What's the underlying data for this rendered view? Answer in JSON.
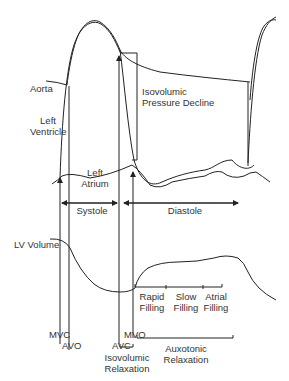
{
  "diagram": {
    "type": "cardiac-cycle-wiggers",
    "traces": {
      "aorta": "Aorta",
      "left_ventricle_line1": "Left",
      "left_ventricle_line2": "Ventricle",
      "left_atrium_line1": "Left",
      "left_atrium_line2": "Atrium",
      "lv_volume": "LV Volume"
    },
    "annotations": {
      "isovolumic_pressure_decline_line1": "Isovolumic",
      "isovolumic_pressure_decline_line2": "Pressure Decline"
    },
    "phases": {
      "systole": "Systole",
      "diastole": "Diastole"
    },
    "filling": {
      "rapid_line1": "Rapid",
      "rapid_line2": "Filling",
      "slow_line1": "Slow",
      "slow_line2": "Filling",
      "atrial_line1": "Atrial",
      "atrial_line2": "Filling"
    },
    "valve_events": {
      "mvc": "MVC",
      "avo": "AVO",
      "avc": "AVC",
      "mvo": "MVO"
    },
    "relaxation": {
      "isovolumic_line1": "Isovolumic",
      "isovolumic_line2": "Relaxation",
      "auxotonic_line1": "Auxotonic",
      "auxotonic_line2": "Relaxation"
    },
    "colors": {
      "line": "#222222",
      "text": "#333333",
      "background": "#ffffff"
    }
  }
}
